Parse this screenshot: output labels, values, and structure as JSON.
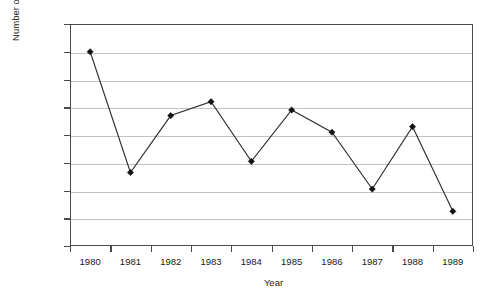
{
  "chart_data": {
    "type": "line",
    "title": "",
    "xlabel": "Year",
    "ylabel": "Number of cases",
    "categories": [
      "1980",
      "1981",
      "1982",
      "1983",
      "1984",
      "1985",
      "1986",
      "1987",
      "1988",
      "1989"
    ],
    "values": [
      140000,
      53000,
      94000,
      104000,
      61000,
      98000,
      82000,
      41000,
      86000,
      25000
    ],
    "series": [
      {
        "name": "Number of cases",
        "values": [
          140000,
          53000,
          94000,
          104000,
          61000,
          98000,
          82000,
          41000,
          86000,
          25000
        ]
      }
    ],
    "ylim": [
      0,
      160000
    ],
    "ytick_values": [
      0,
      20000,
      40000,
      60000,
      80000,
      100000,
      120000,
      140000,
      160000
    ],
    "ytick_labels": [
      "0",
      "20 000",
      "40 000",
      "60 000",
      "80 000",
      "100 000",
      "120 000",
      "140 000",
      "160 000"
    ],
    "grid": "horizontal",
    "legend": "none",
    "marker": "diamond",
    "line_color": "#2b2b2b",
    "marker_color": "#111111",
    "gridline_color": "#c3c3c3",
    "axis_color": "#4a4a4a",
    "background_color": "#ffffff"
  }
}
